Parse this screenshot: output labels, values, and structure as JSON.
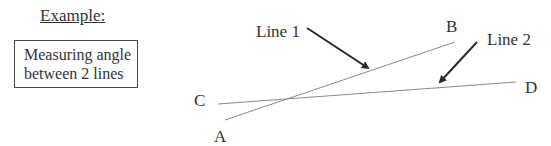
{
  "example": {
    "heading": "Example",
    "colon": ":",
    "caption_line1": "Measuring angle",
    "caption_line2": "between 2 lines"
  },
  "diagram": {
    "points": {
      "A": "A",
      "B": "B",
      "C": "C",
      "D": "D"
    },
    "callouts": {
      "line1": "Line 1",
      "line2": "Line 2"
    },
    "lines": [
      {
        "name": "Line 1",
        "from": "A",
        "to": "B"
      },
      {
        "name": "Line 2",
        "from": "C",
        "to": "D"
      }
    ],
    "colors": {
      "line": "#888888",
      "arrow": "#2a2a2a",
      "text": "#333333"
    }
  }
}
